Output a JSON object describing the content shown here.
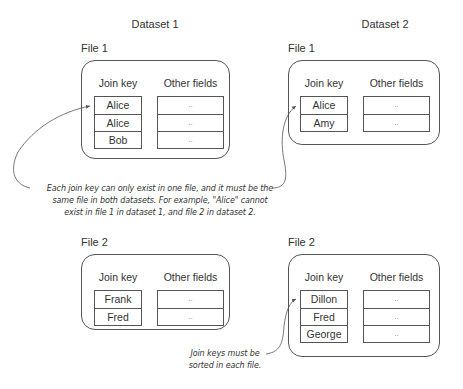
{
  "datasets": [
    {
      "title": "Dataset 1",
      "files": [
        {
          "label": "File 1",
          "join_key_header": "Join key",
          "other_header": "Other fields",
          "keys": [
            "Alice",
            "Alice",
            "Bob"
          ],
          "others": [
            "..",
            "..",
            ".."
          ]
        },
        {
          "label": "File 2",
          "join_key_header": "Join key",
          "other_header": "Other fields",
          "keys": [
            "Frank",
            "Fred"
          ],
          "others": [
            "..",
            ".."
          ]
        }
      ]
    },
    {
      "title": "Dataset 2",
      "files": [
        {
          "label": "File 1",
          "join_key_header": "Join key",
          "other_header": "Other fields",
          "keys": [
            "Alice",
            "Amy"
          ],
          "others": [
            "..",
            ".."
          ]
        },
        {
          "label": "File 2",
          "join_key_header": "Join key",
          "other_header": "Other fields",
          "keys": [
            "Dillon",
            "Fred",
            "George"
          ],
          "others": [
            "..",
            "..",
            ".."
          ]
        }
      ]
    }
  ],
  "annotations": {
    "same_file": [
      "Each join key can only exist in one file, and it must be the",
      "same file in both datasets. For example, \"Alice\" cannot",
      "exist in file 1 in dataset 1, and file 2 in dataset 2."
    ],
    "sorted": [
      "Join keys must be",
      "sorted in each file."
    ]
  }
}
